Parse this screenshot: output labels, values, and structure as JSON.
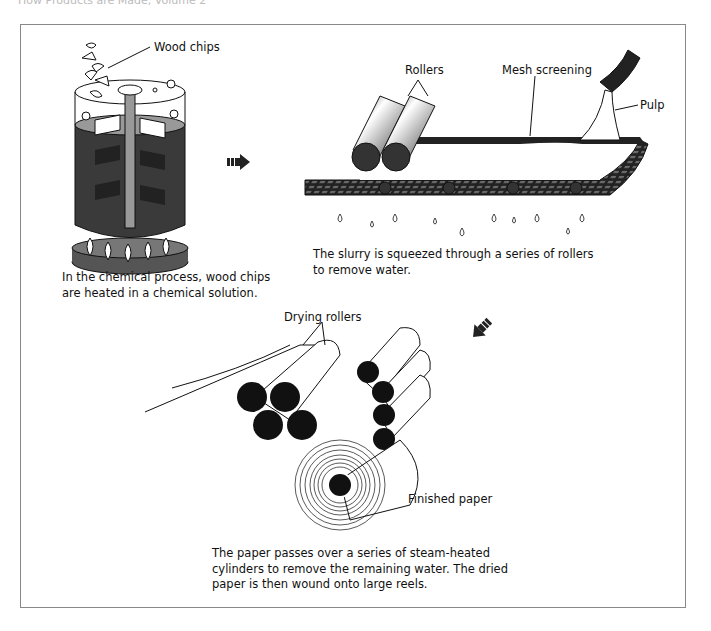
{
  "header": {
    "title": "How Products are Made, Volume 2"
  },
  "step1": {
    "label_wood_chips": "Wood chips",
    "caption_line1": "In the chemical process, wood chips",
    "caption_line2": "are heated in a chemical solution."
  },
  "step2": {
    "label_rollers": "Rollers",
    "label_mesh": "Mesh screening",
    "label_pulp": "Pulp",
    "caption_line1": "The slurry is squeezed through a series of rollers",
    "caption_line2": "to remove water."
  },
  "step3": {
    "label_drying": "Drying rollers",
    "label_finished": "Finished paper",
    "caption_line1": "The paper passes over a series of steam-heated",
    "caption_line2": "cylinders to remove the remaining water. The dried",
    "caption_line3": "paper is then wound onto large reels."
  },
  "colors": {
    "ink": "#111111",
    "liquid": "#3a3a3a",
    "frame": "#888888",
    "surface": "#a8a8a8"
  }
}
